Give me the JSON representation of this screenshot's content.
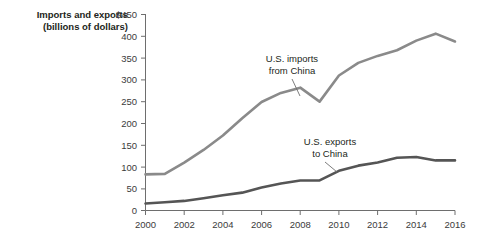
{
  "chart_data": {
    "type": "line",
    "title": "",
    "ylabel": "Imports and exports (billions of dollars)",
    "ylabel_line1": "Imports and exports",
    "ylabel_line2": "(billions of dollars)",
    "xlabel": "",
    "x": [
      2000,
      2001,
      2002,
      2003,
      2004,
      2005,
      2006,
      2007,
      2008,
      2009,
      2010,
      2011,
      2012,
      2013,
      2014,
      2015,
      2016
    ],
    "xlim": [
      2000,
      2016
    ],
    "ylim": [
      0,
      450
    ],
    "grid": false,
    "legend_position": "inline-annotations",
    "y_tick_values": [
      0,
      50,
      100,
      150,
      200,
      250,
      300,
      350,
      400,
      450
    ],
    "y_tick_labels": [
      "0",
      "50",
      "100",
      "150",
      "200",
      "250",
      "300",
      "350",
      "400",
      "$450"
    ],
    "x_tick_values": [
      2000,
      2002,
      2004,
      2006,
      2008,
      2010,
      2012,
      2014,
      2016
    ],
    "x_tick_labels": [
      "2000",
      "2002",
      "2004",
      "2006",
      "2008",
      "2010",
      "2012",
      "2014",
      "2016"
    ],
    "series": [
      {
        "name": "U.S. imports from China",
        "label_line1": "U.S. imports",
        "label_line2": "from China",
        "color": "#8a8a8a",
        "width": 2.6,
        "values": [
          83,
          84,
          110,
          139,
          172,
          212,
          249,
          270,
          282,
          250,
          310,
          339,
          355,
          368,
          390,
          406,
          388
        ]
      },
      {
        "name": "U.S. exports to China",
        "label_line1": "U.S. exports",
        "label_line2": "to China",
        "color": "#555555",
        "width": 2.6,
        "values": [
          16,
          19,
          22,
          28,
          35,
          41,
          53,
          62,
          69,
          69,
          91,
          103,
          110,
          121,
          123,
          115,
          115
        ]
      }
    ],
    "annotations": [
      {
        "text": "U.S. imports from China",
        "series": "U.S. imports from China",
        "points_to_year": 2008
      },
      {
        "text": "U.S. exports to China",
        "series": "U.S. exports to China",
        "points_to_year": 2010
      }
    ]
  }
}
